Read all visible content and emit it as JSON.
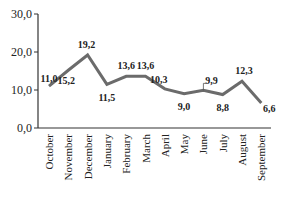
{
  "chart_data": {
    "type": "line",
    "title": "",
    "xlabel": "",
    "ylabel": "",
    "ylim": [
      0,
      30
    ],
    "yticks": [
      "0,0",
      "10,0",
      "20,0",
      "30,0"
    ],
    "grid": false,
    "legend": null,
    "categories": [
      "October",
      "November",
      "December",
      "January",
      "February",
      "March",
      "April",
      "May",
      "June",
      "July",
      "August",
      "September"
    ],
    "series": [
      {
        "name": "",
        "color": "#6b6b6b",
        "values": [
          11.0,
          15.2,
          19.2,
          11.5,
          13.6,
          13.6,
          10.3,
          9.0,
          9.9,
          8.8,
          12.3,
          6.6
        ],
        "labels": [
          "11,0",
          "15,2",
          "19,2",
          "11,5",
          "13,6",
          "13,6",
          "10,3",
          "9,0",
          "9,9",
          "8,8",
          "12,3",
          "6,6"
        ]
      }
    ]
  }
}
